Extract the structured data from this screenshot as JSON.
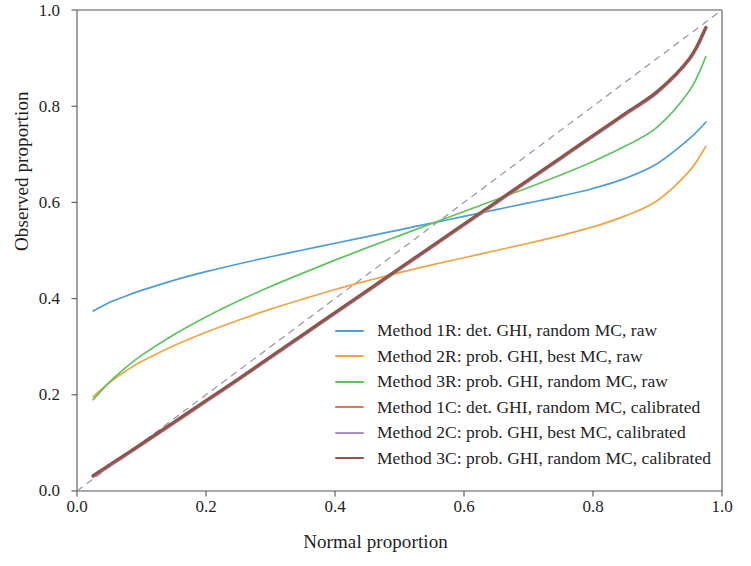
{
  "chart_data": {
    "type": "line",
    "title": "",
    "xlabel": "Normal proportion",
    "ylabel": "Observed proportion",
    "xlim": [
      0.0,
      1.0
    ],
    "ylim": [
      0.0,
      1.0
    ],
    "xticks": [
      "0.0",
      "0.2",
      "0.4",
      "0.6",
      "0.8",
      "1.0"
    ],
    "xtick_values": [
      0.0,
      0.2,
      0.4,
      0.6,
      0.8,
      1.0
    ],
    "yticks": [
      "0.0",
      "0.2",
      "0.4",
      "0.6",
      "0.8",
      "1.0"
    ],
    "ytick_values": [
      0.0,
      0.2,
      0.4,
      0.6,
      0.8,
      1.0
    ],
    "grid": false,
    "legend_position": "center-right",
    "reference_line": {
      "name": "diagonal",
      "style": "dashed",
      "color": "#9b8fae",
      "x": [
        0.0,
        1.0
      ],
      "y": [
        0.0,
        1.0
      ]
    },
    "x": [
      0.025,
      0.05,
      0.075,
      0.1,
      0.15,
      0.2,
      0.25,
      0.3,
      0.35,
      0.4,
      0.45,
      0.5,
      0.55,
      0.6,
      0.65,
      0.7,
      0.75,
      0.8,
      0.85,
      0.9,
      0.95,
      0.975
    ],
    "series": [
      {
        "name": "Method 1R: det. GHI, random MC, raw",
        "color": "#4c9ed9",
        "values": [
          0.374,
          0.392,
          0.405,
          0.417,
          0.438,
          0.456,
          0.472,
          0.487,
          0.501,
          0.515,
          0.529,
          0.543,
          0.557,
          0.571,
          0.585,
          0.599,
          0.613,
          0.629,
          0.65,
          0.681,
          0.733,
          0.767
        ]
      },
      {
        "name": "Method 2R: prob. GHI, best MC, raw",
        "color": "#f0a444",
        "values": [
          0.196,
          0.225,
          0.249,
          0.269,
          0.302,
          0.33,
          0.355,
          0.378,
          0.399,
          0.419,
          0.437,
          0.454,
          0.47,
          0.485,
          0.5,
          0.515,
          0.531,
          0.549,
          0.572,
          0.604,
          0.666,
          0.717
        ]
      },
      {
        "name": "Method 3R: prob. GHI, random MC, raw",
        "color": "#5fc45f",
        "values": [
          0.19,
          0.226,
          0.256,
          0.282,
          0.325,
          0.362,
          0.395,
          0.425,
          0.453,
          0.48,
          0.506,
          0.531,
          0.556,
          0.581,
          0.606,
          0.631,
          0.657,
          0.685,
          0.717,
          0.757,
          0.833,
          0.903
        ]
      },
      {
        "name": "Method 1C: det. GHI, random MC, calibrated",
        "color": "#e8705f",
        "values": [
          0.03,
          0.052,
          0.074,
          0.096,
          0.141,
          0.186,
          0.231,
          0.277,
          0.323,
          0.369,
          0.415,
          0.461,
          0.507,
          0.553,
          0.599,
          0.645,
          0.691,
          0.737,
          0.783,
          0.829,
          0.898,
          0.962
        ]
      },
      {
        "name": "Method 2C: prob. GHI, best MC, calibrated",
        "color": "#a98ec9",
        "values": [
          0.031,
          0.053,
          0.075,
          0.097,
          0.142,
          0.187,
          0.232,
          0.278,
          0.324,
          0.37,
          0.416,
          0.462,
          0.508,
          0.554,
          0.6,
          0.646,
          0.692,
          0.738,
          0.784,
          0.83,
          0.899,
          0.963
        ]
      },
      {
        "name": "Method 3C: prob. GHI, random MC, calibrated",
        "color": "#8c564b",
        "values": [
          0.032,
          0.054,
          0.076,
          0.098,
          0.143,
          0.188,
          0.233,
          0.279,
          0.325,
          0.371,
          0.417,
          0.463,
          0.509,
          0.555,
          0.601,
          0.647,
          0.693,
          0.739,
          0.785,
          0.831,
          0.9,
          0.964
        ]
      }
    ]
  },
  "axes": {
    "spine_color": "#555555"
  }
}
